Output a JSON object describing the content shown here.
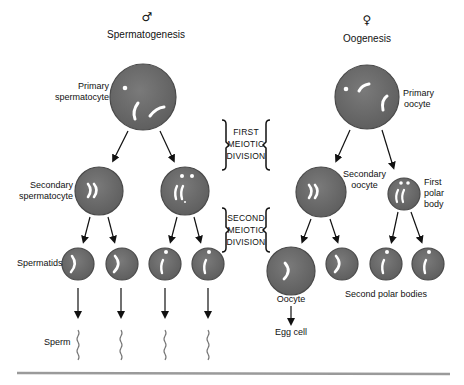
{
  "male": {
    "symbol": "♂",
    "title": "Spermatogenesis",
    "labels": {
      "primary": [
        "Primary",
        "spermatocyte"
      ],
      "secondary": [
        "Secondary",
        "spermatocyte"
      ],
      "spermatids": "Spermatids",
      "sperm": "Sperm"
    }
  },
  "female": {
    "symbol": "♀",
    "title": "Oogenesis",
    "labels": {
      "primary": [
        "Primary",
        "oocyte"
      ],
      "secondary": [
        "Secondary",
        "oocyte"
      ],
      "first_polar": [
        "First",
        "polar",
        "body"
      ],
      "oocyte": "Oocyte",
      "egg": "Egg cell",
      "second_polar": "Second polar bodies"
    }
  },
  "divisions": {
    "first": [
      "FIRST",
      "MEIOTIC",
      "DIVISION"
    ],
    "second": [
      "SECOND",
      "MEIOTIC",
      "DIVISION"
    ]
  },
  "colors": {
    "cell_fill": "#6e6e6e",
    "cell_stroke": "#4a4a4a",
    "chromosome": "#ffffff",
    "arrow": "#111111",
    "baseline": "#9a9a9a"
  }
}
